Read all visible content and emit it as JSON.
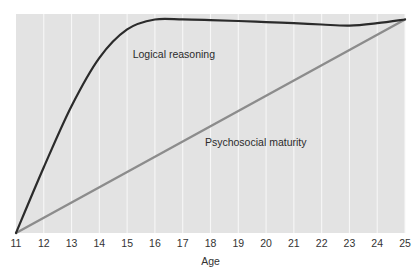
{
  "chart_data": {
    "type": "line",
    "title": "",
    "subtitle": "",
    "xlabel": "Age",
    "ylabel": "",
    "xlim": [
      11,
      25
    ],
    "ylim": [
      0,
      1
    ],
    "grid": "vertical",
    "legend_position": "inline-annotations",
    "categories": [
      11,
      12,
      13,
      14,
      15,
      16,
      17,
      18,
      19,
      20,
      21,
      22,
      23,
      24,
      25
    ],
    "tick_labels": [
      "11",
      "12",
      "13",
      "14",
      "15",
      "16",
      "17",
      "18",
      "19",
      "20",
      "21",
      "22",
      "23",
      "24",
      "25"
    ],
    "series": [
      {
        "name": "Logical reasoning",
        "color": "#2b2b2b",
        "label_x": 15.2,
        "label_y": 0.8,
        "x": [
          11,
          12,
          13,
          14,
          15,
          16,
          17,
          18,
          19,
          20,
          21,
          22,
          23,
          24,
          25
        ],
        "values": [
          0.0,
          0.3,
          0.58,
          0.8,
          0.93,
          0.975,
          0.975,
          0.972,
          0.968,
          0.963,
          0.958,
          0.952,
          0.947,
          0.958,
          0.975
        ]
      },
      {
        "name": "Psychosocial maturity",
        "color": "#8c8c8c",
        "label_x": 17.8,
        "label_y": 0.395,
        "x": [
          11,
          12,
          13,
          14,
          15,
          16,
          17,
          18,
          19,
          20,
          21,
          22,
          23,
          24,
          25
        ],
        "values": [
          0.0,
          0.0696,
          0.1393,
          0.2089,
          0.2786,
          0.3482,
          0.4179,
          0.4875,
          0.5571,
          0.6268,
          0.6964,
          0.7661,
          0.8357,
          0.9054,
          0.975
        ]
      }
    ]
  },
  "axis": {
    "x_title": "Age"
  },
  "annotations": {
    "logical_reasoning": "Logical reasoning",
    "psychosocial_maturity": "Psychosocial maturity"
  }
}
